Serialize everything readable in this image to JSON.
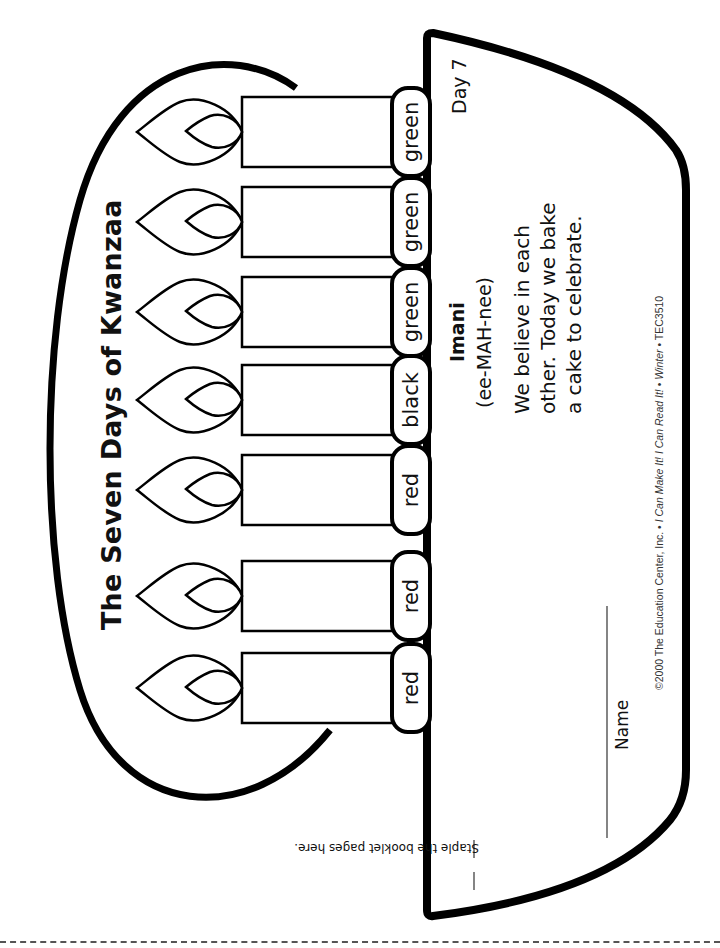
{
  "page": {
    "title": "The Seven Days of Kwanzaa",
    "candles": [
      {
        "label": "green"
      },
      {
        "label": "green"
      },
      {
        "label": "green"
      },
      {
        "label": "black"
      },
      {
        "label": "red"
      },
      {
        "label": "red"
      },
      {
        "label": "red"
      }
    ],
    "booklet": {
      "day": "Day 7",
      "principle": "Imani",
      "pronunciation": "(ee-MAH-nee)",
      "text_lines": [
        "We believe in each",
        "other. Today we bake",
        "a cake to celebrate."
      ],
      "name_label": "Name",
      "staple_note": "Staple the booklet pages here.",
      "copyright_plain": "©2000 The Education Center, Inc. • ",
      "copyright_italic_1": "I Can Make It! I Can Read It!",
      "copyright_sep": " • ",
      "copyright_italic_2": "Winter",
      "copyright_tail": " • TEC3510"
    },
    "cut_line": "dashed"
  }
}
